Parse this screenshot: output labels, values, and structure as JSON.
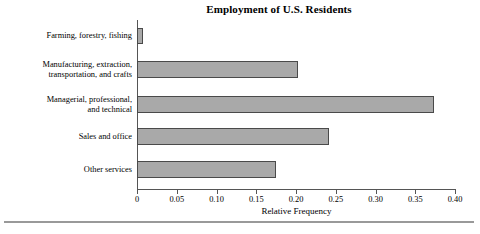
{
  "chart_data": {
    "type": "bar",
    "orientation": "horizontal",
    "title": "Employment of U.S. Residents",
    "xlabel": "Relative Frequency",
    "ylabel": "",
    "xlim": [
      0,
      0.4
    ],
    "grid": false,
    "legend": false,
    "bar_fill_color": "#a9a9a9",
    "bar_edge_color": "#4a4a4a",
    "axis_color": "#555555",
    "xticks": [
      "0",
      "0.05",
      "0.10",
      "0.15",
      "0.20",
      "0.25",
      "0.30",
      "0.35",
      "0.40"
    ],
    "xtick_values": [
      0,
      0.05,
      0.1,
      0.15,
      0.2,
      0.25,
      0.3,
      0.35,
      0.4
    ],
    "categories": [
      "Farming, forestry, fishing",
      "Manufacturing, extraction, transportation, and crafts",
      "Managerial, professional, and technical",
      "Sales and office",
      "Other services"
    ],
    "category_lines": [
      [
        "Farming, forestry, fishing"
      ],
      [
        "Manufacturing, extraction,",
        "transportation, and crafts"
      ],
      [
        "Managerial, professional,",
        "and technical"
      ],
      [
        "Sales and office"
      ],
      [
        "Other services"
      ]
    ],
    "values": [
      0.007,
      0.203,
      0.373,
      0.242,
      0.175
    ]
  }
}
